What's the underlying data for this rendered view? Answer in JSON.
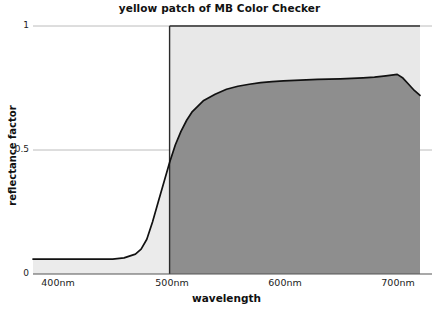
{
  "chart_data": {
    "type": "area",
    "title": "yellow patch of MB Color Checker",
    "xlabel": "wavelength",
    "ylabel": "reflectance factor",
    "xlim": [
      380,
      720
    ],
    "ylim": [
      0,
      1
    ],
    "grid": true,
    "legend": "none",
    "xticks": [
      {
        "value": 400,
        "label": "400nm"
      },
      {
        "value": 500,
        "label": "500nm"
      },
      {
        "value": 600,
        "label": "600nm"
      },
      {
        "value": 700,
        "label": "700nm"
      }
    ],
    "yticks": [
      {
        "value": 0,
        "label": "0"
      },
      {
        "value": 0.5,
        "label": "0.5"
      },
      {
        "value": 1,
        "label": "1"
      }
    ],
    "series": [
      {
        "name": "reflectance factor",
        "x": [
          380,
          390,
          400,
          410,
          420,
          430,
          440,
          450,
          460,
          470,
          475,
          480,
          485,
          490,
          495,
          500,
          505,
          510,
          515,
          520,
          530,
          540,
          550,
          560,
          570,
          580,
          590,
          600,
          610,
          620,
          630,
          640,
          650,
          660,
          670,
          680,
          690,
          700,
          705,
          710,
          715,
          720
        ],
        "y": [
          0.06,
          0.06,
          0.06,
          0.06,
          0.06,
          0.06,
          0.06,
          0.06,
          0.065,
          0.08,
          0.1,
          0.14,
          0.21,
          0.29,
          0.37,
          0.45,
          0.52,
          0.575,
          0.62,
          0.655,
          0.7,
          0.725,
          0.745,
          0.757,
          0.765,
          0.772,
          0.776,
          0.779,
          0.781,
          0.783,
          0.785,
          0.786,
          0.787,
          0.789,
          0.791,
          0.794,
          0.799,
          0.805,
          0.79,
          0.765,
          0.74,
          0.72
        ]
      }
    ],
    "annotations": {
      "shaded_band_start_nm": 500,
      "shaded_band_end_nm": 720,
      "band_fill_above_curve": "#e8e8e8",
      "band_fill_below_curve": "#8e8e8e",
      "left_region_fill": "#ebebeb",
      "curve_color": "#111111"
    }
  },
  "colors": {
    "accent": "#8e8e8e",
    "light": "#e8e8e8",
    "curve": "#111111",
    "axis": "#555555",
    "grid": "#bcbcbc"
  }
}
